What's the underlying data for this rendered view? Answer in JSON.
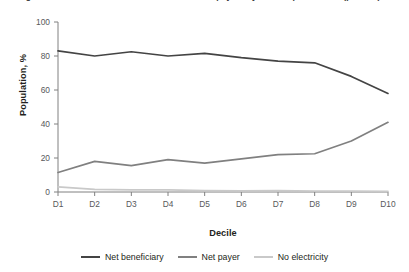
{
  "figure": {
    "title": "Figure: Distribution of net beneficiaries and net payers by consumption decile (percent)"
  },
  "axes": {
    "y_title": "Population, %",
    "x_title": "Decile",
    "y_ticks": [
      "0",
      "20",
      "40",
      "60",
      "80",
      "100"
    ],
    "x_ticks": [
      "D1",
      "D2",
      "D3",
      "D4",
      "D5",
      "D6",
      "D7",
      "D8",
      "D9",
      "D10"
    ]
  },
  "legend": [
    {
      "label": "Net beneficiary",
      "color": "#444444"
    },
    {
      "label": "Net payer",
      "color": "#808080"
    },
    {
      "label": "No electricity",
      "color": "#c9c9c9"
    }
  ],
  "colors": {
    "net_beneficiary": "#444444",
    "net_payer": "#808080",
    "no_electricity": "#c9c9c9",
    "axis": "#808080",
    "text": "#231f20"
  },
  "chart_data": {
    "type": "line",
    "title": "Distribution of net beneficiaries and net payers by consumption decile",
    "xlabel": "Decile",
    "ylabel": "Population, %",
    "categories": [
      "D1",
      "D2",
      "D3",
      "D4",
      "D5",
      "D6",
      "D7",
      "D8",
      "D9",
      "D10"
    ],
    "ylim": [
      0,
      100
    ],
    "yticks": [
      0,
      20,
      40,
      60,
      80,
      100
    ],
    "grid": false,
    "legend_position": "bottom",
    "series": [
      {
        "name": "Net beneficiary",
        "color": "#444444",
        "values": [
          83,
          80,
          82.5,
          80,
          81.5,
          79,
          77,
          76,
          68,
          58
        ]
      },
      {
        "name": "Net payer",
        "color": "#808080",
        "values": [
          11.5,
          18,
          15.5,
          19,
          17,
          19.5,
          22,
          22.5,
          30,
          41
        ]
      },
      {
        "name": "No electricity",
        "color": "#c9c9c9",
        "values": [
          3,
          1.5,
          1.2,
          1.3,
          0.8,
          0.7,
          0.8,
          0.6,
          0.5,
          0.4
        ]
      }
    ]
  }
}
